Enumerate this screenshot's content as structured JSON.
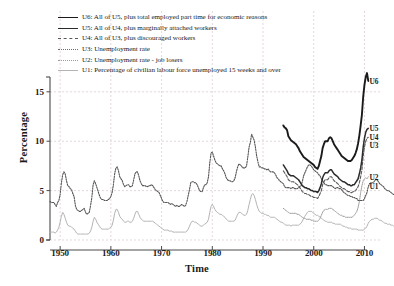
{
  "chart_data": {
    "type": "line",
    "title": "",
    "xlabel": "Time",
    "ylabel": "Percentage",
    "xlim": [
      1948,
      2010.5
    ],
    "ylim": [
      0,
      16.5
    ],
    "xticks": [
      1950,
      1960,
      1970,
      1980,
      1990,
      2000,
      2010
    ],
    "yticks": [
      0,
      5,
      10,
      15
    ],
    "grid": true,
    "legend_position": "top-left",
    "legend": [
      {
        "key": "U6",
        "label": "U6: All of U5, plus total employed part time for economic reasons",
        "style": "solid",
        "color": "#1a1a1a",
        "width": 1.9
      },
      {
        "key": "U5",
        "label": "U5: All of U4, plus marginally attached workers",
        "style": "solid",
        "color": "#2b2b2b",
        "width": 1.5
      },
      {
        "key": "U4",
        "label": "U4: All of U3, plus discouraged workers",
        "style": "dashed",
        "color": "#5a5a5a",
        "width": 1.1
      },
      {
        "key": "U3",
        "label": "U3: Unemployment rate",
        "style": "dotted",
        "color": "#6e6e6e",
        "width": 1.1
      },
      {
        "key": "U2",
        "label": "U2: Unemployment rate - job losers",
        "style": "dotted-fine",
        "color": "#9a9a9a",
        "width": 1.0
      },
      {
        "key": "U1",
        "label": "U1: Percentage of civilian labour force unemployed 15 weeks and over",
        "style": "solid",
        "color": "#b4b4b4",
        "width": 1.0
      }
    ],
    "end_labels": [
      {
        "key": "U6",
        "text": "U6",
        "x": 2010.4,
        "y": 16.1
      },
      {
        "key": "U5",
        "text": "U5",
        "x": 2010.4,
        "y": 11.3
      },
      {
        "key": "U4",
        "text": "U4",
        "x": 2010.4,
        "y": 10.4
      },
      {
        "key": "U3",
        "text": "U3",
        "x": 2010.4,
        "y": 9.6
      },
      {
        "key": "U2",
        "text": "U2",
        "x": 2010.4,
        "y": 6.4
      },
      {
        "key": "U1",
        "text": "U1",
        "x": 2010.4,
        "y": 5.5
      }
    ],
    "series": [
      {
        "name": "U3",
        "label": "U3: Unemployment rate",
        "color": "#555555",
        "x_start": 1948.0,
        "x_step": 0.25,
        "values": [
          3.9,
          3.8,
          3.8,
          3.8,
          3.6,
          3.4,
          3.8,
          4.0,
          4.6,
          5.8,
          6.6,
          6.9,
          6.7,
          6.0,
          5.5,
          5.4,
          5.2,
          5.1,
          4.7,
          4.4,
          3.5,
          3.1,
          3.0,
          2.9,
          2.9,
          3.0,
          3.1,
          3.2,
          2.8,
          2.6,
          2.7,
          2.8,
          3.5,
          4.3,
          5.6,
          6.0,
          5.7,
          5.3,
          4.9,
          4.5,
          4.2,
          4.1,
          4.1,
          4.0,
          4.0,
          4.0,
          4.1,
          4.2,
          4.4,
          4.8,
          5.6,
          6.7,
          7.3,
          7.4,
          7.0,
          6.4,
          6.2,
          6.0,
          5.6,
          5.4,
          5.5,
          5.6,
          5.6,
          5.4,
          5.4,
          5.5,
          6.1,
          6.7,
          6.9,
          6.9,
          6.5,
          6.0,
          5.7,
          5.5,
          5.5,
          5.5,
          5.4,
          5.4,
          5.5,
          5.5,
          5.6,
          5.5,
          5.3,
          5.1,
          5.0,
          4.9,
          4.8,
          4.5,
          4.2,
          3.9,
          3.8,
          3.8,
          3.8,
          3.8,
          3.7,
          3.6,
          3.7,
          3.6,
          3.5,
          3.4,
          3.5,
          3.4,
          3.4,
          3.5,
          3.6,
          3.5,
          3.4,
          3.5,
          3.9,
          4.5,
          5.1,
          5.8,
          5.9,
          5.9,
          5.8,
          5.8,
          5.6,
          5.3,
          5.0,
          4.9,
          4.9,
          5.3,
          5.6,
          5.6,
          5.8,
          6.4,
          7.8,
          8.8,
          8.9,
          8.5,
          8.1,
          7.8,
          7.7,
          7.6,
          7.5,
          7.5,
          7.2,
          7.0,
          6.7,
          6.3,
          6.1,
          6.0,
          6.0,
          5.9,
          5.9,
          6.0,
          6.3,
          6.9,
          7.4,
          7.7,
          7.6,
          7.5,
          7.3,
          7.3,
          7.3,
          7.5,
          8.4,
          9.4,
          9.9,
          10.7,
          10.4,
          10.1,
          9.4,
          8.5,
          7.9,
          7.4,
          7.4,
          7.3,
          7.3,
          7.2,
          7.2,
          7.1,
          7.2,
          7.0,
          6.9,
          6.9,
          6.9,
          6.8,
          6.6,
          6.3,
          6.2,
          6.0,
          5.9,
          5.8,
          5.7,
          5.4,
          5.3,
          5.3,
          5.3,
          5.3,
          5.2,
          5.3,
          5.3,
          5.2,
          5.2,
          5.2,
          5.3,
          5.4,
          5.5,
          5.9,
          6.5,
          6.8,
          7.1,
          7.4,
          7.6,
          7.6,
          7.5,
          7.3,
          7.1,
          7.0,
          6.9,
          6.8,
          6.6,
          6.5,
          6.2,
          6.0,
          5.8,
          5.6,
          5.6,
          5.5,
          5.5,
          5.5,
          5.5,
          5.4,
          5.3,
          5.2,
          5.3,
          5.3,
          5.2,
          5.2,
          5.1,
          4.9,
          4.8,
          4.7,
          4.6,
          4.5,
          4.5,
          4.4,
          4.4,
          4.3,
          4.3,
          4.2,
          4.2,
          4.0,
          4.0,
          4.0,
          4.0,
          4.0,
          4.2,
          4.5,
          4.8,
          5.4,
          5.7,
          5.8,
          5.8,
          5.8,
          6.0,
          6.1,
          6.1,
          5.9,
          5.7,
          5.6,
          5.5,
          5.4,
          5.2,
          5.1,
          5.0,
          5.0,
          4.9,
          4.8,
          4.7,
          4.6,
          4.6,
          4.5,
          4.5,
          4.5,
          4.6,
          4.6,
          4.7,
          4.9,
          5.1,
          5.4,
          6.0,
          6.9,
          8.1,
          9.0,
          9.6,
          9.8,
          9.9,
          9.7,
          9.6
        ]
      },
      {
        "name": "U1",
        "label": "U1: Percentage of civilian labour force unemployed 15 weeks and over",
        "color": "#b4b4b4",
        "x_start": 1948.0,
        "x_step": 0.25,
        "values": [
          0.8,
          0.8,
          0.8,
          0.8,
          0.7,
          0.8,
          1.0,
          1.3,
          1.8,
          2.4,
          2.8,
          2.6,
          2.2,
          1.8,
          1.5,
          1.4,
          1.4,
          1.3,
          1.2,
          1.1,
          0.9,
          0.7,
          0.6,
          0.6,
          0.6,
          0.6,
          0.6,
          0.6,
          0.6,
          0.6,
          0.6,
          0.7,
          0.9,
          1.3,
          1.9,
          2.3,
          2.1,
          1.8,
          1.6,
          1.4,
          1.2,
          1.1,
          1.1,
          1.1,
          1.1,
          1.1,
          1.1,
          1.2,
          1.3,
          1.5,
          2.0,
          2.7,
          3.1,
          3.1,
          2.8,
          2.4,
          2.2,
          2.1,
          1.9,
          1.8,
          1.8,
          1.9,
          1.9,
          1.8,
          1.8,
          1.9,
          2.2,
          2.6,
          2.9,
          2.9,
          2.6,
          2.3,
          2.1,
          2.0,
          1.9,
          1.9,
          1.9,
          1.9,
          1.9,
          1.9,
          1.9,
          1.9,
          1.8,
          1.7,
          1.6,
          1.5,
          1.4,
          1.3,
          1.2,
          1.1,
          1.0,
          1.0,
          1.0,
          1.0,
          0.9,
          0.9,
          0.9,
          0.8,
          0.8,
          0.8,
          0.8,
          0.8,
          0.8,
          0.8,
          0.8,
          0.8,
          0.8,
          0.8,
          0.9,
          1.1,
          1.4,
          1.7,
          1.9,
          1.9,
          1.8,
          1.8,
          1.7,
          1.6,
          1.5,
          1.4,
          1.4,
          1.5,
          1.6,
          1.7,
          1.8,
          2.1,
          2.8,
          3.4,
          3.6,
          3.4,
          3.1,
          2.9,
          2.8,
          2.7,
          2.6,
          2.6,
          2.5,
          2.4,
          2.3,
          2.1,
          2.0,
          1.9,
          1.9,
          1.9,
          1.9,
          1.9,
          2.0,
          2.3,
          2.6,
          2.8,
          2.8,
          2.7,
          2.6,
          2.5,
          2.5,
          2.6,
          3.0,
          3.6,
          4.1,
          4.6,
          4.7,
          4.5,
          4.1,
          3.6,
          3.2,
          2.9,
          2.8,
          2.7,
          2.7,
          2.6,
          2.6,
          2.5,
          2.5,
          2.4,
          2.3,
          2.3,
          2.3,
          2.3,
          2.2,
          2.1,
          2.0,
          1.9,
          1.8,
          1.8,
          1.7,
          1.6,
          1.5,
          1.5,
          1.5,
          1.5,
          1.4,
          1.5,
          1.5,
          1.5,
          1.5,
          1.5,
          1.5,
          1.6,
          1.7,
          1.9,
          2.2,
          2.4,
          2.6,
          2.8,
          2.9,
          2.9,
          2.9,
          2.8,
          2.7,
          2.6,
          2.5,
          2.5,
          2.4,
          2.3,
          2.2,
          2.1,
          2.0,
          1.9,
          1.9,
          1.8,
          1.8,
          1.8,
          1.8,
          1.7,
          1.7,
          1.6,
          1.6,
          1.6,
          1.6,
          1.6,
          1.5,
          1.4,
          1.4,
          1.3,
          1.3,
          1.2,
          1.2,
          1.2,
          1.1,
          1.1,
          1.1,
          1.1,
          1.1,
          1.0,
          1.0,
          1.0,
          1.0,
          1.0,
          1.1,
          1.2,
          1.4,
          1.7,
          1.9,
          2.0,
          2.1,
          2.1,
          2.2,
          2.2,
          2.2,
          2.1,
          2.0,
          2.0,
          1.9,
          1.8,
          1.7,
          1.7,
          1.6,
          1.6,
          1.6,
          1.5,
          1.5,
          1.4,
          1.4,
          1.4,
          1.3,
          1.3,
          1.4,
          1.4,
          1.5,
          1.7,
          1.9,
          2.3,
          2.9,
          3.7,
          4.5,
          5.1,
          5.4,
          5.5,
          5.5,
          5.5
        ]
      },
      {
        "name": "U2",
        "label": "U2: Unemployment rate - job losers",
        "color": "#9a9a9a",
        "x_start": 1994.0,
        "x_step": 0.25,
        "values": [
          3.2,
          3.1,
          3.0,
          2.9,
          2.8,
          2.7,
          2.7,
          2.7,
          2.7,
          2.7,
          2.7,
          2.6,
          2.6,
          2.5,
          2.4,
          2.3,
          2.2,
          2.2,
          2.1,
          2.1,
          2.1,
          2.1,
          2.0,
          2.0,
          1.9,
          1.9,
          1.9,
          1.9,
          2.0,
          2.2,
          2.5,
          2.8,
          3.0,
          3.1,
          3.1,
          3.1,
          3.2,
          3.2,
          3.2,
          3.1,
          3.0,
          2.9,
          2.8,
          2.7,
          2.6,
          2.5,
          2.5,
          2.4,
          2.4,
          2.3,
          2.3,
          2.3,
          2.3,
          2.3,
          2.3,
          2.4,
          2.5,
          2.7,
          2.9,
          3.3,
          3.9,
          4.8,
          5.5,
          6.0,
          6.2,
          6.3,
          6.2,
          6.4
        ]
      },
      {
        "name": "U4",
        "label": "U4: All of U3, plus discouraged workers",
        "color": "#5a5a5a",
        "x_start": 1994.0,
        "x_step": 0.25,
        "values": [
          7.0,
          6.8,
          6.6,
          6.4,
          6.1,
          6.0,
          5.9,
          5.9,
          5.9,
          5.8,
          5.7,
          5.6,
          5.5,
          5.3,
          5.1,
          4.9,
          4.8,
          4.7,
          4.7,
          4.6,
          4.6,
          4.5,
          4.4,
          4.4,
          4.3,
          4.3,
          4.3,
          4.2,
          4.4,
          4.7,
          5.0,
          5.6,
          5.9,
          6.1,
          6.1,
          6.1,
          6.3,
          6.4,
          6.4,
          6.2,
          6.0,
          5.9,
          5.8,
          5.7,
          5.5,
          5.4,
          5.3,
          5.2,
          5.2,
          5.1,
          5.0,
          4.9,
          4.9,
          4.8,
          4.8,
          4.9,
          4.9,
          5.0,
          5.2,
          5.4,
          5.8,
          6.4,
          7.1,
          8.5,
          9.4,
          10.0,
          10.3,
          10.4
        ]
      },
      {
        "name": "U5",
        "label": "U5: All of U4, plus marginally attached workers",
        "color": "#2b2b2b",
        "x_start": 1994.0,
        "x_step": 0.25,
        "values": [
          7.6,
          7.4,
          7.2,
          7.0,
          6.7,
          6.6,
          6.5,
          6.5,
          6.5,
          6.4,
          6.3,
          6.2,
          6.1,
          5.9,
          5.7,
          5.5,
          5.4,
          5.3,
          5.3,
          5.2,
          5.2,
          5.1,
          5.0,
          5.0,
          4.9,
          4.9,
          4.9,
          4.8,
          5.0,
          5.3,
          5.7,
          6.3,
          6.6,
          6.8,
          6.8,
          6.8,
          7.0,
          7.1,
          7.1,
          6.9,
          6.7,
          6.6,
          6.5,
          6.4,
          6.2,
          6.1,
          6.0,
          5.9,
          5.9,
          5.8,
          5.7,
          5.6,
          5.6,
          5.5,
          5.5,
          5.6,
          5.6,
          5.8,
          6.0,
          6.2,
          6.7,
          7.3,
          8.1,
          9.4,
          10.3,
          10.9,
          11.2,
          11.3
        ]
      },
      {
        "name": "U6",
        "label": "U6: All of U5, plus total employed part time for economic reasons",
        "color": "#1a1a1a",
        "x_start": 1994.0,
        "x_step": 0.25,
        "values": [
          11.6,
          11.4,
          11.3,
          11.1,
          10.5,
          10.3,
          10.1,
          10.0,
          9.9,
          9.8,
          9.7,
          9.5,
          9.3,
          9.0,
          8.8,
          8.6,
          8.4,
          8.3,
          8.2,
          8.1,
          8.0,
          7.9,
          7.8,
          7.7,
          7.6,
          7.4,
          7.3,
          7.2,
          7.5,
          8.0,
          8.5,
          9.3,
          9.7,
          10.0,
          10.0,
          10.0,
          10.3,
          10.4,
          10.3,
          10.0,
          9.7,
          9.5,
          9.3,
          9.1,
          8.9,
          8.7,
          8.5,
          8.4,
          8.3,
          8.2,
          8.1,
          8.0,
          8.0,
          8.0,
          8.1,
          8.3,
          8.5,
          8.8,
          9.2,
          9.8,
          10.6,
          11.6,
          12.7,
          14.5,
          15.7,
          16.5,
          16.9,
          16.1
        ]
      }
    ]
  }
}
